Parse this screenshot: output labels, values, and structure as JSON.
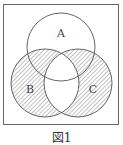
{
  "diagram": {
    "type": "venn",
    "caption": "図1",
    "colors": {
      "stroke": "#555555",
      "hatch": "#777777",
      "background": "#ffffff"
    },
    "box": {
      "x": 3.5,
      "y": 4.5,
      "width": 115,
      "height": 120
    },
    "sets": [
      {
        "id": "A",
        "label": "A",
        "cx": 61,
        "cy": 47,
        "r": 34,
        "label_x": 61,
        "label_y": 37
      },
      {
        "id": "B",
        "label": "B",
        "cx": 45,
        "cy": 83,
        "r": 34,
        "label_x": 30,
        "label_y": 92
      },
      {
        "id": "C",
        "label": "C",
        "cx": 78,
        "cy": 83,
        "r": 34,
        "label_x": 93,
        "label_y": 92
      }
    ],
    "shaded_region": "B XOR C (symmetric difference of B and C)"
  }
}
